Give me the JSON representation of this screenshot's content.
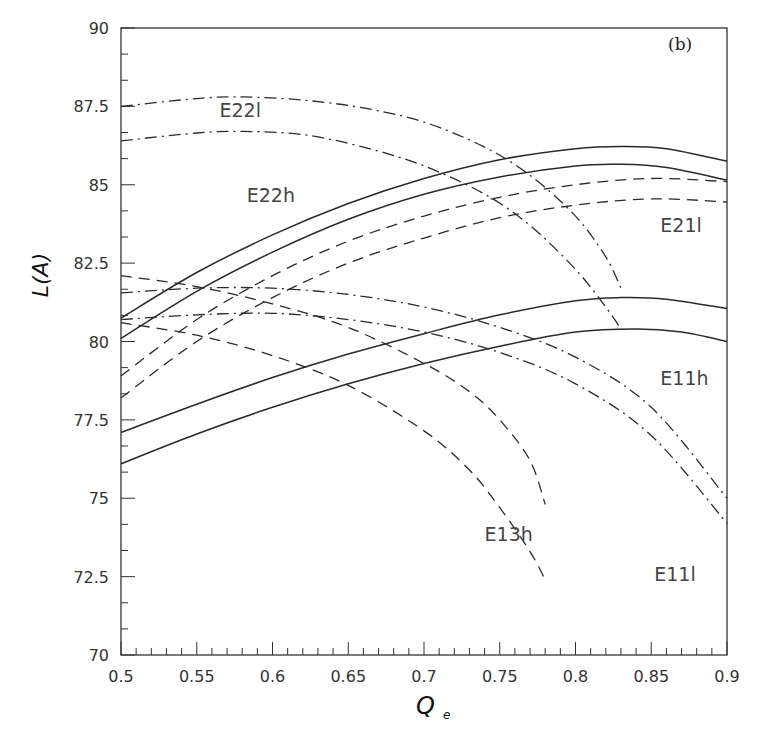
{
  "chart_data": {
    "type": "line",
    "title": "",
    "panel_label": "(b)",
    "xlabel": "Q",
    "xlabel_subscript": "e",
    "ylabel": "L(A)",
    "xlim": [
      0.5,
      0.9
    ],
    "ylim": [
      70,
      90
    ],
    "x_ticks": [
      0.5,
      0.55,
      0.6,
      0.65,
      0.7,
      0.75,
      0.8,
      0.85,
      0.9
    ],
    "x_tick_labels": [
      "0.5",
      "0.55",
      "0.6",
      "0.65",
      "0.7",
      "0.75",
      "0.8",
      "0.85",
      "0.9"
    ],
    "y_ticks": [
      70,
      72.5,
      75,
      77.5,
      80,
      82.5,
      85,
      87.5,
      90
    ],
    "y_tick_labels": [
      "70",
      "72.5",
      "75",
      "77.5",
      "80",
      "82.5",
      "85",
      "87.5",
      "90"
    ],
    "grid": false,
    "legend": "inline curve labels",
    "series": [
      {
        "name": "E22h upper",
        "group": "E22h",
        "style": "solid",
        "x": [
          0.5,
          0.55,
          0.6,
          0.65,
          0.7,
          0.75,
          0.8,
          0.83,
          0.86,
          0.9
        ],
        "y": [
          80.75,
          82.2,
          83.4,
          84.4,
          85.2,
          85.8,
          86.15,
          86.22,
          86.15,
          85.75
        ]
      },
      {
        "name": "E22h lower",
        "group": "E22h",
        "style": "solid",
        "x": [
          0.5,
          0.55,
          0.6,
          0.65,
          0.7,
          0.75,
          0.8,
          0.83,
          0.86,
          0.9
        ],
        "y": [
          80.1,
          81.6,
          82.85,
          83.9,
          84.7,
          85.25,
          85.6,
          85.65,
          85.55,
          85.15
        ]
      },
      {
        "name": "E11h upper",
        "group": "E11h",
        "style": "solid",
        "x": [
          0.5,
          0.55,
          0.6,
          0.65,
          0.7,
          0.75,
          0.8,
          0.83,
          0.86,
          0.9
        ],
        "y": [
          77.1,
          78.0,
          78.85,
          79.6,
          80.25,
          80.85,
          81.3,
          81.4,
          81.35,
          81.05
        ]
      },
      {
        "name": "E11h lower",
        "group": "E11h",
        "style": "solid",
        "x": [
          0.5,
          0.55,
          0.6,
          0.65,
          0.7,
          0.75,
          0.8,
          0.84,
          0.87,
          0.9
        ],
        "y": [
          76.1,
          77.05,
          77.9,
          78.65,
          79.3,
          79.85,
          80.3,
          80.4,
          80.3,
          80.0
        ]
      },
      {
        "name": "E22l upper",
        "group": "E22l",
        "style": "dashdot",
        "x": [
          0.5,
          0.55,
          0.58,
          0.62,
          0.66,
          0.7,
          0.74,
          0.77,
          0.8,
          0.82,
          0.83
        ],
        "y": [
          87.5,
          87.75,
          87.8,
          87.7,
          87.45,
          87.0,
          86.2,
          85.3,
          84.0,
          82.7,
          81.7
        ]
      },
      {
        "name": "E22l lower",
        "group": "E22l",
        "style": "dashdot",
        "x": [
          0.5,
          0.55,
          0.58,
          0.62,
          0.66,
          0.7,
          0.74,
          0.77,
          0.8,
          0.82,
          0.83
        ],
        "y": [
          86.4,
          86.65,
          86.7,
          86.6,
          86.2,
          85.6,
          84.7,
          83.7,
          82.3,
          81.1,
          80.4
        ]
      },
      {
        "name": "E21l upper",
        "group": "E21l",
        "style": "dashed",
        "x": [
          0.5,
          0.55,
          0.6,
          0.65,
          0.7,
          0.75,
          0.8,
          0.85,
          0.9
        ],
        "y": [
          78.9,
          80.7,
          82.1,
          83.2,
          84.0,
          84.6,
          85.0,
          85.2,
          85.1
        ]
      },
      {
        "name": "E21l lower",
        "group": "E21l",
        "style": "dashed",
        "x": [
          0.5,
          0.55,
          0.6,
          0.65,
          0.7,
          0.75,
          0.8,
          0.85,
          0.9
        ],
        "y": [
          78.2,
          80.0,
          81.4,
          82.5,
          83.3,
          83.95,
          84.35,
          84.55,
          84.45
        ]
      },
      {
        "name": "E11l upper",
        "group": "E11l",
        "style": "dashdot",
        "x": [
          0.5,
          0.55,
          0.6,
          0.65,
          0.7,
          0.75,
          0.8,
          0.85,
          0.9
        ],
        "y": [
          81.55,
          81.7,
          81.7,
          81.5,
          81.1,
          80.45,
          79.5,
          77.9,
          75.0
        ]
      },
      {
        "name": "E11l lower",
        "group": "E11l",
        "style": "dashdot",
        "x": [
          0.5,
          0.55,
          0.6,
          0.65,
          0.7,
          0.75,
          0.8,
          0.85,
          0.9
        ],
        "y": [
          80.7,
          80.85,
          80.9,
          80.7,
          80.3,
          79.65,
          78.65,
          77.0,
          74.2
        ]
      },
      {
        "name": "E13h upper",
        "group": "E13h",
        "style": "dashed",
        "x": [
          0.5,
          0.55,
          0.6,
          0.65,
          0.7,
          0.73,
          0.75,
          0.77,
          0.78
        ],
        "y": [
          82.1,
          81.75,
          81.2,
          80.45,
          79.3,
          78.4,
          77.5,
          76.2,
          74.8
        ]
      },
      {
        "name": "E13h lower",
        "group": "E13h",
        "style": "dashed",
        "x": [
          0.5,
          0.55,
          0.6,
          0.65,
          0.7,
          0.73,
          0.75,
          0.77,
          0.78
        ],
        "y": [
          80.6,
          80.2,
          79.55,
          78.6,
          77.15,
          75.9,
          74.7,
          73.3,
          72.4
        ]
      }
    ],
    "annotations": [
      {
        "text": "E22l",
        "x": 0.565,
        "y": 87.15
      },
      {
        "text": "E22h",
        "x": 0.583,
        "y": 84.45
      },
      {
        "text": "E21l",
        "x": 0.856,
        "y": 83.5
      },
      {
        "text": "E11h",
        "x": 0.856,
        "y": 78.6
      },
      {
        "text": "E13h",
        "x": 0.74,
        "y": 73.65
      },
      {
        "text": "E11l",
        "x": 0.852,
        "y": 72.35
      }
    ]
  }
}
